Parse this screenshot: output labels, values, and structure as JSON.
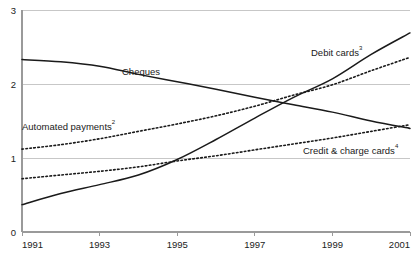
{
  "chart_data": {
    "type": "line",
    "title": "",
    "subtitle": "",
    "xlabel": "",
    "ylabel": "",
    "xlim": [
      1991,
      2001
    ],
    "ylim": [
      0,
      3
    ],
    "grid": true,
    "legend_position": "inline-annotations",
    "x_ticks": [
      "1991",
      "1993",
      "1995",
      "1997",
      "1999",
      "2001"
    ],
    "x_tick_values": [
      1991,
      1993,
      1995,
      1997,
      1999,
      2001
    ],
    "y_ticks": [
      "0",
      "1",
      "2",
      "3"
    ],
    "y_tick_values": [
      0,
      1,
      2,
      3
    ],
    "x": [
      1991,
      1992,
      1993,
      1994,
      1995,
      1996,
      1997,
      1998,
      1999,
      2000,
      2001
    ],
    "series": [
      {
        "name": "Cheques",
        "label": "Cheques",
        "superscript": "",
        "style": "solid",
        "color": "#1a1a1a",
        "values": [
          2.33,
          2.3,
          2.24,
          2.13,
          2.03,
          1.93,
          1.82,
          1.72,
          1.62,
          1.5,
          1.4
        ]
      },
      {
        "name": "Automated payments",
        "label": "Automated payments",
        "superscript": "2",
        "style": "dotted",
        "color": "#1a1a1a",
        "values": [
          1.12,
          1.18,
          1.26,
          1.36,
          1.46,
          1.57,
          1.7,
          1.85,
          1.99,
          2.18,
          2.36
        ]
      },
      {
        "name": "Debit cards",
        "label": "Debit cards",
        "superscript": "3",
        "style": "solid",
        "color": "#1a1a1a",
        "values": [
          0.37,
          0.52,
          0.64,
          0.77,
          0.98,
          1.25,
          1.54,
          1.82,
          2.07,
          2.4,
          2.69
        ]
      },
      {
        "name": "Credit & charge cards",
        "label": "Credit & charge cards",
        "superscript": "4",
        "style": "dotted",
        "color": "#1a1a1a",
        "values": [
          0.72,
          0.77,
          0.82,
          0.88,
          0.96,
          1.03,
          1.11,
          1.19,
          1.27,
          1.36,
          1.45
        ]
      }
    ],
    "annotations": [
      {
        "name": "cheques-label",
        "text": "Cheques",
        "superscript": "",
        "x_px": 122,
        "y_px": 75
      },
      {
        "name": "debit-cards-label",
        "text": "Debit cards",
        "superscript": "3",
        "x_px": 311,
        "y_px": 56
      },
      {
        "name": "automated-label",
        "text": "Automated payments",
        "superscript": "2",
        "x_px": 22,
        "y_px": 130
      },
      {
        "name": "credit-cards-label",
        "text": "Credit & charge cards",
        "superscript": "4",
        "x_px": 303,
        "y_px": 154
      }
    ]
  },
  "plot": {
    "left_px": 22,
    "right_px": 410,
    "top_px": 10,
    "bottom_px": 232,
    "grid_color": "#b9b9b9",
    "axis_color": "#9a9a9a",
    "background": "#ffffff",
    "line_color": "#1a1a1a"
  }
}
